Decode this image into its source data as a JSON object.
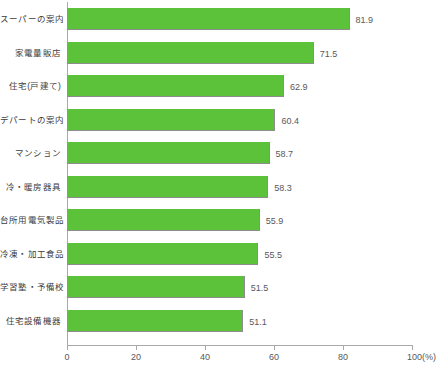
{
  "chart_data": {
    "type": "bar",
    "orientation": "horizontal",
    "title": "",
    "subtitle": "",
    "xlabel": "",
    "ylabel": "",
    "xlim": [
      0,
      100
    ],
    "xticks": [
      0,
      20,
      40,
      60,
      80,
      100
    ],
    "xtick_labels": [
      "0",
      "20",
      "40",
      "60",
      "80",
      "100(%)"
    ],
    "unit_label": "(%)",
    "grid": false,
    "legend": null,
    "bar_color": "#5cc23a",
    "categories": [
      "スーパーの案内",
      "家電量販店",
      "住宅(戸建て)",
      "デパートの案内",
      "マンション",
      "冷・暖房器具",
      "台所用電気製品",
      "冷凍・加工食品",
      "学習塾・予備校",
      "住宅設備機器"
    ],
    "values": [
      81.9,
      71.5,
      62.9,
      60.4,
      58.7,
      58.3,
      55.9,
      55.5,
      51.5,
      51.1
    ],
    "value_labels": [
      "81.9",
      "71.5",
      "62.9",
      "60.4",
      "58.7",
      "58.3",
      "55.9",
      "55.5",
      "51.5",
      "51.1"
    ]
  }
}
